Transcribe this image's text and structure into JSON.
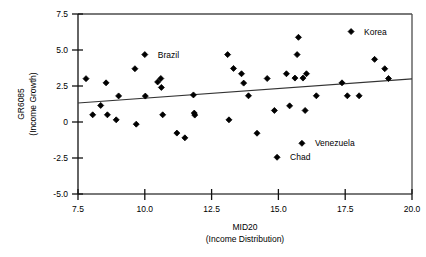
{
  "chart_data": {
    "type": "scatter",
    "title": "",
    "xlabel": "MID20",
    "xlabel_sub": "(Income Distribution)",
    "ylabel": "GR6085",
    "ylabel_sub": "(Income Growth)",
    "xlim": [
      7.5,
      20.0
    ],
    "ylim": [
      -5.0,
      7.5
    ],
    "xticks": [
      7.5,
      10.0,
      12.5,
      15.0,
      17.5,
      20.0
    ],
    "xtick_labels": [
      "7.5",
      "10.0",
      "12.5",
      "15.0",
      "17.5",
      "20.0"
    ],
    "yticks": [
      7.5,
      5.0,
      2.5,
      0,
      -2.5,
      -5.0
    ],
    "ytick_labels": [
      "7.5",
      "5.0",
      "2.5",
      "0",
      "-2.5",
      "-5.0"
    ],
    "grid": false,
    "legend": false,
    "marker": "diamond",
    "marker_color": "#000000",
    "line_color": "#333333",
    "axis_color": "#4d4d4d",
    "series": [
      {
        "name": "Countries",
        "points": [
          {
            "x": 7.8,
            "y": 3.01
          },
          {
            "x": 8.05,
            "y": 0.5
          },
          {
            "x": 8.35,
            "y": 1.15
          },
          {
            "x": 8.55,
            "y": 2.72
          },
          {
            "x": 8.6,
            "y": 0.5
          },
          {
            "x": 8.93,
            "y": 0.15
          },
          {
            "x": 9.02,
            "y": 1.81
          },
          {
            "x": 9.63,
            "y": 3.7
          },
          {
            "x": 9.68,
            "y": -0.15
          },
          {
            "x": 10.0,
            "y": 4.68,
            "label": "Brazil",
            "label_dx": 13,
            "label_dy": 3
          },
          {
            "x": 10.02,
            "y": 1.8
          },
          {
            "x": 10.48,
            "y": 2.78
          },
          {
            "x": 10.6,
            "y": 3.02
          },
          {
            "x": 10.62,
            "y": 2.4
          },
          {
            "x": 10.67,
            "y": 0.5
          },
          {
            "x": 11.2,
            "y": -0.77
          },
          {
            "x": 11.5,
            "y": -1.1
          },
          {
            "x": 11.82,
            "y": 1.88
          },
          {
            "x": 11.85,
            "y": 0.62
          },
          {
            "x": 11.87,
            "y": 0.48
          },
          {
            "x": 13.1,
            "y": 4.68
          },
          {
            "x": 13.15,
            "y": 0.15
          },
          {
            "x": 13.32,
            "y": 3.72
          },
          {
            "x": 13.62,
            "y": 3.35
          },
          {
            "x": 13.7,
            "y": 2.7
          },
          {
            "x": 13.88,
            "y": 1.82
          },
          {
            "x": 14.2,
            "y": -0.78
          },
          {
            "x": 14.58,
            "y": 3.02
          },
          {
            "x": 14.85,
            "y": 0.8
          },
          {
            "x": 15.3,
            "y": 3.35
          },
          {
            "x": 15.42,
            "y": 1.12
          },
          {
            "x": 15.62,
            "y": 3.05
          },
          {
            "x": 15.7,
            "y": 4.68
          },
          {
            "x": 15.75,
            "y": 5.88
          },
          {
            "x": 15.92,
            "y": 3.05
          },
          {
            "x": 16.0,
            "y": 0.8
          },
          {
            "x": 16.05,
            "y": 3.35
          },
          {
            "x": 16.42,
            "y": 1.82
          },
          {
            "x": 17.38,
            "y": 2.72
          },
          {
            "x": 17.58,
            "y": 1.82
          },
          {
            "x": 18.02,
            "y": 1.82
          },
          {
            "x": 18.6,
            "y": 4.35
          },
          {
            "x": 18.98,
            "y": 3.7
          },
          {
            "x": 19.12,
            "y": 3.02
          },
          {
            "x": 15.88,
            "y": -1.48,
            "label": "Venezuela",
            "label_dx": 13,
            "label_dy": 3
          },
          {
            "x": 14.95,
            "y": -2.45,
            "label": "Chad",
            "label_dx": 13,
            "label_dy": 3
          },
          {
            "x": 17.72,
            "y": 6.28,
            "label": "Korea",
            "label_dx": 13,
            "label_dy": 3
          }
        ]
      }
    ],
    "trendline": {
      "x0": 7.5,
      "y0": 1.32,
      "x1": 20.0,
      "y1": 2.99
    }
  }
}
